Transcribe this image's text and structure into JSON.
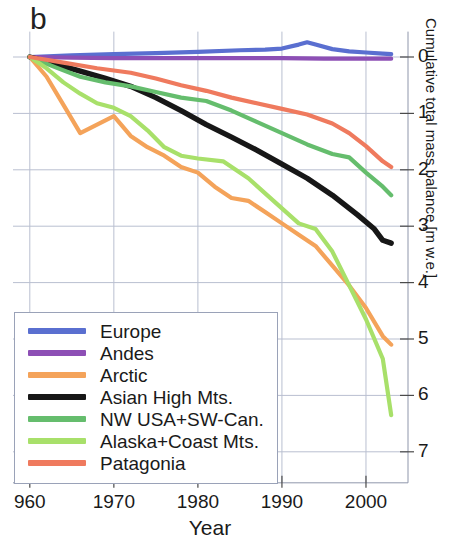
{
  "figure": {
    "panel_label": "b",
    "xlabel": "Year",
    "ylabel": "Cumulative total mass balance [m w.e.]"
  },
  "axes": {
    "xticks": [
      "960",
      "1970",
      "1980",
      "1990",
      "2000"
    ],
    "xtick_values": [
      1960,
      1970,
      1980,
      1990,
      2000
    ],
    "yticks": [
      "0",
      "1",
      "2",
      "3",
      "4",
      "5",
      "6",
      "7"
    ],
    "ytick_values": [
      0,
      1,
      2,
      3,
      4,
      5,
      6,
      7
    ]
  },
  "legend": {
    "items": [
      {
        "label": "Europe",
        "color": "#5a6fd0"
      },
      {
        "label": "Andes",
        "color": "#8d4fb5"
      },
      {
        "label": "Arctic",
        "color": "#f4a35a"
      },
      {
        "label": "Asian High Mts.",
        "color": "#171717"
      },
      {
        "label": "NW USA+SW-Can.",
        "color": "#65bd6d"
      },
      {
        "label": "Alaska+Coast Mts.",
        "color": "#a8e06a"
      },
      {
        "label": "Patagonia",
        "color": "#ef7a5e"
      }
    ]
  },
  "chart_data": {
    "type": "line",
    "title": "",
    "xlabel": "Year",
    "ylabel": "Cumulative total mass balance [m w.e.]",
    "xlim": [
      1958,
      2005
    ],
    "ylim": [
      7.6,
      -0.45
    ],
    "y_axis_inverted": true,
    "y_axis_position": "right",
    "grid": true,
    "legend_position": "lower-left",
    "note": "Y values are cumulative mass loss in metres water equivalent, plotted as positive-downward magnitudes.",
    "series": [
      {
        "name": "Europe",
        "color": "#5a6fd0",
        "x": [
          1960,
          1965,
          1970,
          1975,
          1980,
          1985,
          1988,
          1990,
          1992,
          1993,
          1994,
          1996,
          1998,
          2000,
          2002,
          2003
        ],
        "values": [
          0.0,
          -0.03,
          -0.05,
          -0.07,
          -0.09,
          -0.12,
          -0.13,
          -0.15,
          -0.22,
          -0.26,
          -0.22,
          -0.14,
          -0.1,
          -0.08,
          -0.06,
          -0.05
        ]
      },
      {
        "name": "Andes",
        "color": "#8d4fb5",
        "x": [
          1960,
          1965,
          1970,
          1975,
          1980,
          1985,
          1990,
          1995,
          2000,
          2003
        ],
        "values": [
          0.0,
          0.01,
          0.02,
          0.02,
          0.02,
          0.02,
          0.02,
          0.03,
          0.03,
          0.03
        ]
      },
      {
        "name": "Arctic",
        "color": "#f4a35a",
        "x": [
          1960,
          1962,
          1964,
          1966,
          1968,
          1970,
          1972,
          1974,
          1976,
          1978,
          1980,
          1982,
          1984,
          1986,
          1988,
          1990,
          1992,
          1994,
          1996,
          1998,
          2000,
          2002,
          2003
        ],
        "values": [
          0.0,
          0.35,
          0.85,
          1.35,
          1.2,
          1.05,
          1.4,
          1.6,
          1.75,
          1.95,
          2.05,
          2.3,
          2.5,
          2.55,
          2.75,
          2.95,
          3.15,
          3.35,
          3.7,
          4.05,
          4.45,
          4.95,
          5.1
        ]
      },
      {
        "name": "Asian High Mts.",
        "color": "#171717",
        "x": [
          1960,
          1963,
          1966,
          1969,
          1972,
          1975,
          1978,
          1981,
          1984,
          1987,
          1990,
          1993,
          1996,
          1999,
          2001,
          2002,
          2003
        ],
        "values": [
          0.0,
          0.12,
          0.25,
          0.38,
          0.52,
          0.72,
          0.95,
          1.2,
          1.42,
          1.65,
          1.9,
          2.15,
          2.45,
          2.8,
          3.05,
          3.25,
          3.3
        ]
      },
      {
        "name": "NW USA+SW-Can.",
        "color": "#65bd6d",
        "x": [
          1960,
          1963,
          1966,
          1969,
          1972,
          1975,
          1978,
          1981,
          1984,
          1987,
          1990,
          1993,
          1996,
          1998,
          2000,
          2002,
          2003
        ],
        "values": [
          0.0,
          0.18,
          0.35,
          0.45,
          0.52,
          0.62,
          0.72,
          0.78,
          0.95,
          1.15,
          1.35,
          1.55,
          1.72,
          1.78,
          2.05,
          2.3,
          2.45
        ]
      },
      {
        "name": "Alaska+Coast Mts.",
        "color": "#a8e06a",
        "x": [
          1960,
          1962,
          1964,
          1966,
          1968,
          1970,
          1972,
          1974,
          1976,
          1978,
          1980,
          1983,
          1986,
          1989,
          1992,
          1994,
          1996,
          1998,
          2000,
          2002,
          2003
        ],
        "values": [
          0.0,
          0.2,
          0.45,
          0.65,
          0.82,
          0.9,
          1.05,
          1.3,
          1.6,
          1.75,
          1.8,
          1.85,
          2.15,
          2.55,
          2.95,
          3.05,
          3.45,
          4.05,
          4.65,
          5.35,
          6.35
        ]
      },
      {
        "name": "Patagonia",
        "color": "#ef7a5e",
        "x": [
          1960,
          1964,
          1968,
          1972,
          1975,
          1978,
          1981,
          1984,
          1987,
          1990,
          1993,
          1996,
          1998,
          2000,
          2002,
          2003
        ],
        "values": [
          0.0,
          0.1,
          0.2,
          0.28,
          0.38,
          0.5,
          0.6,
          0.72,
          0.82,
          0.92,
          1.02,
          1.18,
          1.35,
          1.58,
          1.85,
          1.95
        ]
      }
    ]
  }
}
